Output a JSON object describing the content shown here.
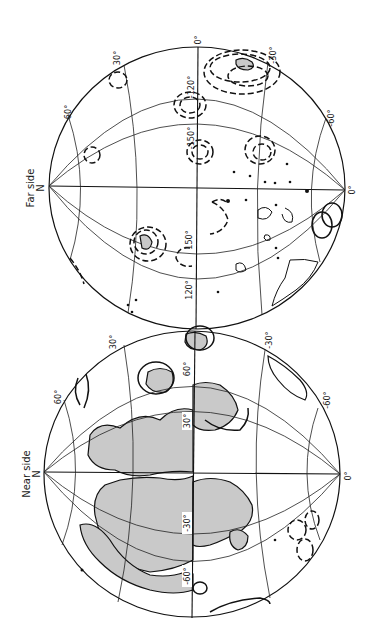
{
  "figure": {
    "orientation": "rotated 90 degrees counter-clockwise",
    "panels": [
      {
        "id": "far-side",
        "title": "Far side",
        "pole_label": "N",
        "latitude_labels": [
          "60°",
          "30°",
          "0°",
          "-30°",
          "-60°",
          "0°"
        ],
        "longitude_labels": [
          "-120°",
          "-150°",
          "150°",
          "120°"
        ],
        "features": "dashed and solid contour rings, small shaded region near top rim, scattered small patches"
      },
      {
        "id": "near-side",
        "title": "Near side",
        "pole_label": "N",
        "latitude_labels": [
          "60°",
          "30°",
          "-30°",
          "-60°",
          "0°"
        ],
        "longitude_labels": [
          "60°",
          "30°",
          "-30°",
          "-60°"
        ],
        "features": "large shaded (stippled) mare regions, solid and dashed contour rings"
      }
    ],
    "labels": {
      "far_title": "Far side",
      "far_pole": "N",
      "far_lat_60": "60°",
      "far_lat_30": "30°",
      "far_lat_0_top": "0°",
      "far_lat_m30": "-30°",
      "far_lat_m60": "-60°",
      "far_lat_0_right": "0°",
      "far_lon_m120": "-120°",
      "far_lon_m150": "-150°",
      "far_lon_150": "150°",
      "far_lon_120": "120°",
      "near_title": "Near side",
      "near_pole": "N",
      "near_lat_60": "60°",
      "near_lat_30": "30°",
      "near_lat_m30": "-30°",
      "near_lat_m60": "-60°",
      "near_lat_0_right": "0°",
      "near_lon_60": "60°",
      "near_lon_30": "30°",
      "near_lon_m30": "-30°",
      "near_lon_m60": "-60°"
    },
    "colors": {
      "line": "#111111",
      "mare_fill": "#c9c9c9",
      "background": "#ffffff"
    }
  }
}
